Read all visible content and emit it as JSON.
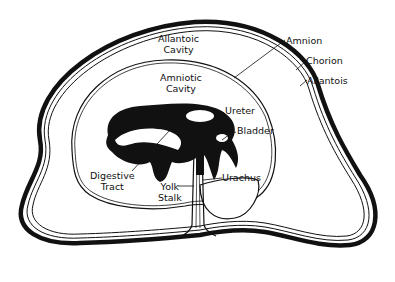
{
  "diagram": {
    "colors": {
      "ink": "#111111",
      "background": "#ffffff"
    },
    "labels": {
      "allantoic_cavity": [
        "Allantoic",
        "Cavity"
      ],
      "amniotic_cavity": [
        "Amniotic",
        "Cavity"
      ],
      "amnion": "Amnion",
      "chorion": "Chorion",
      "allantois": "Allantois",
      "ureter": "Ureter",
      "bladder": "Bladder",
      "digestive_tract": [
        "Digestive",
        "Tract"
      ],
      "yolk_stalk": [
        "Yolk",
        "Stalk"
      ],
      "urachus": "Urachus"
    }
  }
}
